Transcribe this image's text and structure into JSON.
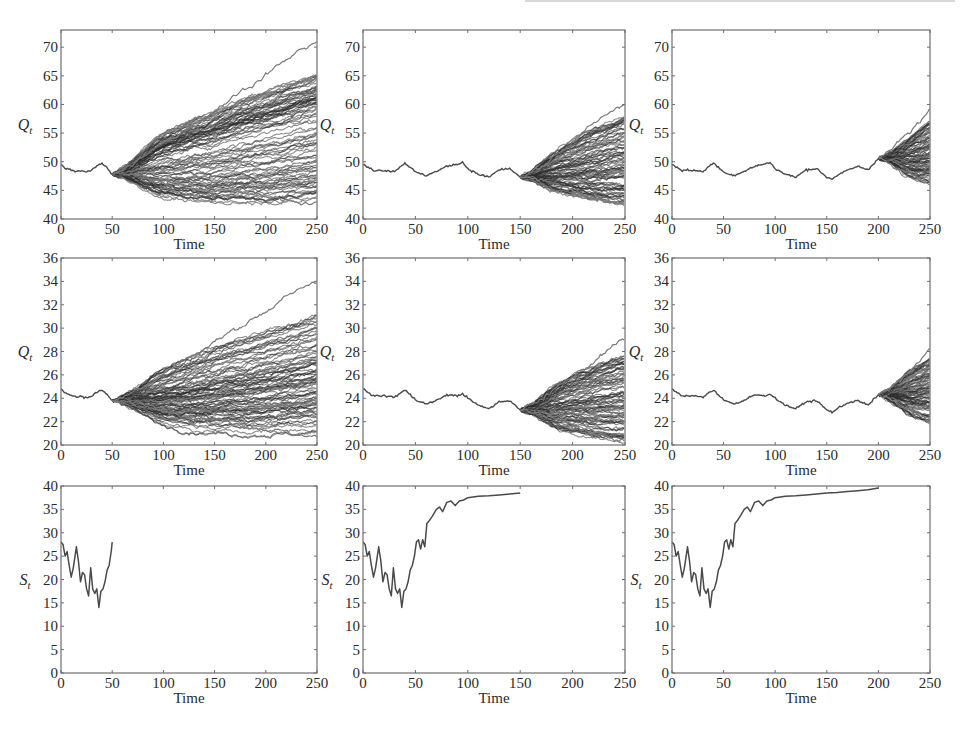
{
  "figure": {
    "layout": {
      "rows": 3,
      "cols": 3
    },
    "colors": {
      "axis": "#6e6e6e",
      "path": "#4a4a4a",
      "fan": "#2b2b2b",
      "fan_light": "#7a7a7a",
      "text": "#2a2a2a",
      "background": "#ffffff"
    }
  },
  "chart_data": [
    {
      "id": "r1c1",
      "type": "line",
      "title": "",
      "xlabel": "Time",
      "ylabel": "Q_t",
      "ylabel_main": "Q",
      "ylabel_sub": "t",
      "xlim": [
        0,
        250
      ],
      "ylim": [
        40,
        73
      ],
      "xticks": [
        0,
        50,
        100,
        150,
        200,
        250
      ],
      "yticks": [
        40,
        45,
        50,
        55,
        60,
        65,
        70
      ],
      "grid": false,
      "legend": null,
      "history": {
        "x": [
          0,
          5,
          10,
          15,
          20,
          25,
          30,
          35,
          40,
          45,
          50
        ],
        "y": [
          49.5,
          48.8,
          48.6,
          48.3,
          48.5,
          48.2,
          48.6,
          49.2,
          49.8,
          48.9,
          47.8
        ]
      },
      "fan": {
        "start_time": 50,
        "start_value": 47.8,
        "end_time": 250,
        "band_low": [
          47.8,
          43.5,
          42.5,
          42.3,
          42.5,
          43.0
        ],
        "band_high": [
          47.8,
          55,
          58,
          61,
          63.5,
          66
        ],
        "band_x": [
          50,
          90,
          130,
          170,
          210,
          250
        ],
        "max_path_end": 72,
        "min_path_end": 42.5,
        "n_paths": "many"
      }
    },
    {
      "id": "r1c2",
      "type": "line",
      "title": "",
      "xlabel": "Time",
      "ylabel": "Q_t",
      "ylabel_main": "Q",
      "ylabel_sub": "t",
      "xlim": [
        0,
        250
      ],
      "ylim": [
        40,
        73
      ],
      "xticks": [
        0,
        50,
        100,
        150,
        200,
        250
      ],
      "yticks": [
        40,
        45,
        50,
        55,
        60,
        65,
        70
      ],
      "grid": false,
      "legend": null,
      "history": {
        "x": [
          0,
          10,
          20,
          30,
          40,
          50,
          60,
          70,
          80,
          90,
          95,
          100,
          110,
          120,
          130,
          140,
          150
        ],
        "y": [
          49.5,
          48.5,
          48.5,
          48.3,
          49.8,
          48.2,
          47.6,
          48.3,
          49.2,
          49.6,
          49.9,
          48.8,
          47.8,
          47.3,
          48.6,
          48.8,
          47.3
        ]
      },
      "fan": {
        "start_time": 150,
        "start_value": 47.3,
        "end_time": 250,
        "band_low": [
          47.3,
          44.5,
          43.2,
          42.5
        ],
        "band_high": [
          47.3,
          52.5,
          56,
          58.5
        ],
        "band_x": [
          150,
          180,
          215,
          250
        ],
        "max_path_end": 61.5,
        "min_path_end": 42.3,
        "n_paths": "many"
      }
    },
    {
      "id": "r1c3",
      "type": "line",
      "title": "",
      "xlabel": "Time",
      "ylabel": "Q_t",
      "ylabel_main": "Q",
      "ylabel_sub": "t",
      "xlim": [
        0,
        250
      ],
      "ylim": [
        40,
        73
      ],
      "xticks": [
        0,
        50,
        100,
        150,
        200,
        250
      ],
      "yticks": [
        40,
        45,
        50,
        55,
        60,
        65,
        70
      ],
      "grid": false,
      "legend": null,
      "history": {
        "x": [
          0,
          10,
          20,
          30,
          40,
          50,
          60,
          70,
          80,
          90,
          95,
          100,
          110,
          120,
          130,
          140,
          150,
          155,
          160,
          170,
          180,
          190,
          200
        ],
        "y": [
          49.5,
          48.5,
          48.5,
          48.3,
          49.8,
          48.2,
          47.6,
          48.3,
          49.2,
          49.6,
          49.9,
          48.8,
          47.8,
          47.3,
          48.6,
          48.8,
          47.3,
          47.0,
          47.6,
          48.5,
          49.2,
          48.6,
          50.6
        ]
      },
      "fan": {
        "start_time": 200,
        "start_value": 50.6,
        "end_time": 250,
        "band_low": [
          50.6,
          47.0,
          46.0
        ],
        "band_high": [
          50.6,
          54.5,
          58.0
        ],
        "band_x": [
          200,
          225,
          250
        ],
        "max_path_end": 60,
        "min_path_end": 45.5,
        "n_paths": "many"
      }
    },
    {
      "id": "r2c1",
      "type": "line",
      "title": "",
      "xlabel": "Time",
      "ylabel": "Q_t",
      "ylabel_main": "Q",
      "ylabel_sub": "t",
      "xlim": [
        0,
        250
      ],
      "ylim": [
        20,
        36
      ],
      "xticks": [
        0,
        50,
        100,
        150,
        200,
        250
      ],
      "yticks": [
        20,
        22,
        24,
        26,
        28,
        30,
        32,
        34,
        36
      ],
      "grid": false,
      "legend": null,
      "history": {
        "x": [
          0,
          5,
          10,
          15,
          20,
          25,
          30,
          35,
          40,
          45,
          50
        ],
        "y": [
          24.8,
          24.4,
          24.3,
          24.1,
          24.2,
          24.0,
          24.2,
          24.5,
          24.7,
          24.3,
          23.8
        ]
      },
      "fan": {
        "start_time": 50,
        "start_value": 23.8,
        "end_time": 250,
        "band_low": [
          23.8,
          21.6,
          21.0,
          20.8,
          20.8,
          21.0
        ],
        "band_high": [
          23.8,
          26.5,
          28.0,
          29.3,
          30.3,
          31.5
        ],
        "band_x": [
          50,
          90,
          130,
          170,
          210,
          250
        ],
        "max_path_end": 34.5,
        "min_path_end": 20.5,
        "n_paths": "many"
      }
    },
    {
      "id": "r2c2",
      "type": "line",
      "title": "",
      "xlabel": "Time",
      "ylabel": "Q_t",
      "ylabel_main": "Q",
      "ylabel_sub": "t",
      "xlim": [
        0,
        250
      ],
      "ylim": [
        20,
        36
      ],
      "xticks": [
        0,
        50,
        100,
        150,
        200,
        250
      ],
      "yticks": [
        20,
        22,
        24,
        26,
        28,
        30,
        32,
        34,
        36
      ],
      "grid": false,
      "legend": null,
      "history": {
        "x": [
          0,
          10,
          20,
          30,
          40,
          50,
          60,
          70,
          80,
          90,
          95,
          100,
          110,
          120,
          130,
          140,
          150
        ],
        "y": [
          24.8,
          24.2,
          24.2,
          24.1,
          24.7,
          23.9,
          23.5,
          23.8,
          24.3,
          24.2,
          24.4,
          24.0,
          23.4,
          23.1,
          23.7,
          23.8,
          23.0
        ]
      },
      "fan": {
        "start_time": 150,
        "start_value": 23.0,
        "end_time": 250,
        "band_low": [
          23.0,
          21.2,
          20.6,
          20.2
        ],
        "band_high": [
          23.0,
          25.5,
          27.0,
          28.0
        ],
        "band_x": [
          150,
          180,
          215,
          250
        ],
        "max_path_end": 29.5,
        "min_path_end": 20.0,
        "n_paths": "many"
      }
    },
    {
      "id": "r2c3",
      "type": "line",
      "title": "",
      "xlabel": "Time",
      "ylabel": "Q_t",
      "ylabel_main": "Q",
      "ylabel_sub": "t",
      "xlim": [
        0,
        250
      ],
      "ylim": [
        20,
        36
      ],
      "xticks": [
        0,
        50,
        100,
        150,
        200,
        250
      ],
      "yticks": [
        20,
        22,
        24,
        26,
        28,
        30,
        32,
        34,
        36
      ],
      "grid": false,
      "legend": null,
      "history": {
        "x": [
          0,
          10,
          20,
          30,
          40,
          50,
          60,
          70,
          80,
          90,
          95,
          100,
          110,
          120,
          130,
          140,
          150,
          155,
          160,
          170,
          180,
          190,
          200
        ],
        "y": [
          24.8,
          24.2,
          24.2,
          24.1,
          24.7,
          23.9,
          23.5,
          23.8,
          24.3,
          24.2,
          24.4,
          24.0,
          23.4,
          23.1,
          23.7,
          23.8,
          23.0,
          22.8,
          23.1,
          23.6,
          23.8,
          23.4,
          24.3
        ]
      },
      "fan": {
        "start_time": 200,
        "start_value": 24.3,
        "end_time": 250,
        "band_low": [
          24.3,
          22.3,
          21.8
        ],
        "band_high": [
          24.3,
          26.5,
          27.8
        ],
        "band_x": [
          200,
          225,
          250
        ],
        "max_path_end": 28.7,
        "min_path_end": 21.7,
        "n_paths": "many"
      }
    },
    {
      "id": "r3c1",
      "type": "line",
      "title": "",
      "xlabel": "Time",
      "ylabel": "S_t",
      "ylabel_main": "S",
      "ylabel_sub": "t",
      "xlim": [
        0,
        250
      ],
      "ylim": [
        0,
        40
      ],
      "xticks": [
        0,
        50,
        100,
        150,
        200,
        250
      ],
      "yticks": [
        0,
        5,
        10,
        15,
        20,
        25,
        30,
        35,
        40
      ],
      "grid": false,
      "legend": null,
      "series": [
        {
          "name": "S_t",
          "x": [
            0,
            2,
            4,
            6,
            8,
            10,
            12,
            15,
            17,
            19,
            21,
            23,
            25,
            27,
            29,
            31,
            33,
            35,
            37,
            39,
            41,
            43,
            45,
            47,
            49,
            50
          ],
          "y": [
            28,
            27.5,
            25,
            26,
            23,
            20.5,
            22.5,
            27,
            24,
            19.5,
            21.5,
            21,
            18,
            16.5,
            22.5,
            18,
            17,
            18,
            14,
            17.5,
            18,
            19.5,
            22,
            23,
            26,
            28
          ]
        }
      ]
    },
    {
      "id": "r3c2",
      "type": "line",
      "title": "",
      "xlabel": "Time",
      "ylabel": "S_t",
      "ylabel_main": "S",
      "ylabel_sub": "t",
      "xlim": [
        0,
        250
      ],
      "ylim": [
        0,
        40
      ],
      "xticks": [
        0,
        50,
        100,
        150,
        200,
        250
      ],
      "yticks": [
        0,
        5,
        10,
        15,
        20,
        25,
        30,
        35,
        40
      ],
      "grid": false,
      "legend": null,
      "series": [
        {
          "name": "S_t",
          "x": [
            0,
            2,
            4,
            6,
            8,
            10,
            12,
            15,
            17,
            19,
            21,
            23,
            25,
            27,
            29,
            31,
            33,
            35,
            37,
            39,
            41,
            43,
            45,
            47,
            49,
            51,
            53,
            55,
            57,
            59,
            61,
            63,
            66,
            70,
            73,
            76,
            80,
            84,
            88,
            92,
            96,
            100,
            110,
            120,
            130,
            140,
            150
          ],
          "y": [
            28,
            27.5,
            25,
            26,
            23,
            20.5,
            22.5,
            27,
            24,
            19.5,
            21.5,
            21,
            18,
            16.5,
            22.5,
            18,
            17,
            18,
            14,
            17.5,
            18,
            19.5,
            22,
            23,
            25,
            28,
            28.5,
            26.5,
            28.5,
            27,
            32,
            32.5,
            33.5,
            35,
            35.5,
            34.5,
            36.5,
            36.8,
            35.8,
            36.8,
            37,
            37.5,
            37.8,
            37.9,
            38.1,
            38.3,
            38.5
          ]
        }
      ]
    },
    {
      "id": "r3c3",
      "type": "line",
      "title": "",
      "xlabel": "Time",
      "ylabel": "S_t",
      "ylabel_main": "S",
      "ylabel_sub": "t",
      "xlim": [
        0,
        250
      ],
      "ylim": [
        0,
        40
      ],
      "xticks": [
        0,
        50,
        100,
        150,
        200,
        250
      ],
      "yticks": [
        0,
        5,
        10,
        15,
        20,
        25,
        30,
        35,
        40
      ],
      "grid": false,
      "legend": null,
      "series": [
        {
          "name": "S_t",
          "x": [
            0,
            2,
            4,
            6,
            8,
            10,
            12,
            15,
            17,
            19,
            21,
            23,
            25,
            27,
            29,
            31,
            33,
            35,
            37,
            39,
            41,
            43,
            45,
            47,
            49,
            51,
            53,
            55,
            57,
            59,
            61,
            63,
            66,
            70,
            73,
            76,
            80,
            84,
            88,
            92,
            96,
            100,
            110,
            120,
            130,
            140,
            150,
            160,
            170,
            180,
            190,
            200
          ],
          "y": [
            28,
            27.5,
            25,
            26,
            23,
            20.5,
            22.5,
            27,
            24,
            19.5,
            21.5,
            21,
            18,
            16.5,
            22.5,
            18,
            17,
            18,
            14,
            17.5,
            18,
            19.5,
            22,
            23,
            25,
            28,
            28.5,
            26.5,
            28.5,
            27,
            32,
            32.5,
            33.5,
            35,
            35.5,
            34.5,
            36.5,
            36.8,
            35.8,
            36.8,
            37,
            37.5,
            37.8,
            37.9,
            38.1,
            38.3,
            38.5,
            38.6,
            38.8,
            39.0,
            39.2,
            39.6
          ]
        }
      ]
    }
  ]
}
